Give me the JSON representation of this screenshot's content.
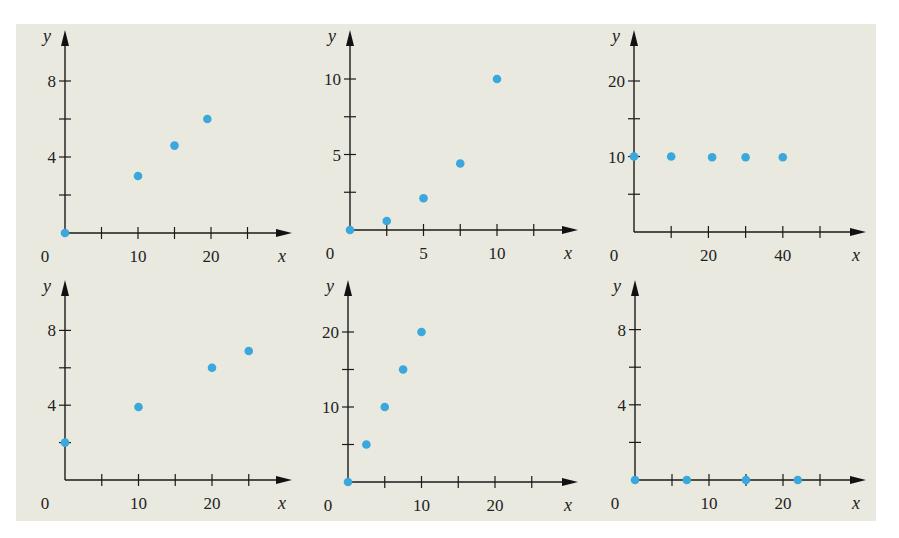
{
  "colors": {
    "background": "#e9e9e0",
    "dot": "#3aa8dc",
    "axis": "#1a1a1a"
  },
  "chart_data": [
    {
      "type": "scatter",
      "title": "",
      "xlabel": "x",
      "ylabel": "y",
      "x_ticks": [
        {
          "value": 0,
          "label": "0"
        },
        {
          "value": 10,
          "label": "10"
        },
        {
          "value": 20,
          "label": "20"
        }
      ],
      "x_minor_step": 5,
      "x_ticks_count": 5,
      "y_ticks": [
        {
          "value": 4,
          "label": "4"
        },
        {
          "value": 8,
          "label": "8"
        }
      ],
      "y_minor_step": 2,
      "y_ticks_count": 4,
      "xlim": [
        0,
        27
      ],
      "ylim": [
        0,
        10
      ],
      "points": [
        {
          "x": 0,
          "y": 0
        },
        {
          "x": 10,
          "y": 3
        },
        {
          "x": 15,
          "y": 4.6
        },
        {
          "x": 19.5,
          "y": 6
        }
      ],
      "layout": {
        "ox": 65,
        "oy": 233,
        "px_per_x": 7.3,
        "px_per_y": 19,
        "x_end": 292,
        "y_top": 30
      }
    },
    {
      "type": "scatter",
      "title": "",
      "xlabel": "x",
      "ylabel": "y",
      "x_ticks": [
        {
          "value": 0,
          "label": "0"
        },
        {
          "value": 5,
          "label": "5"
        },
        {
          "value": 10,
          "label": "10"
        }
      ],
      "x_minor_step": 2.5,
      "x_ticks_count": 5,
      "y_ticks": [
        {
          "value": 5,
          "label": "5"
        },
        {
          "value": 10,
          "label": "10"
        }
      ],
      "y_minor_step": 2.5,
      "y_ticks_count": 4,
      "xlim": [
        0,
        13
      ],
      "ylim": [
        0,
        12
      ],
      "points": [
        {
          "x": 0,
          "y": 0
        },
        {
          "x": 2.5,
          "y": 0.6
        },
        {
          "x": 5,
          "y": 2.1
        },
        {
          "x": 7.5,
          "y": 4.4
        },
        {
          "x": 10,
          "y": 10
        }
      ],
      "layout": {
        "ox": 350,
        "oy": 230,
        "px_per_x": 14.7,
        "px_per_y": 15.1,
        "x_end": 578,
        "y_top": 30
      }
    },
    {
      "type": "scatter",
      "title": "",
      "xlabel": "x",
      "ylabel": "y",
      "x_ticks": [
        {
          "value": 0,
          "label": "0"
        },
        {
          "value": 20,
          "label": "20"
        },
        {
          "value": 40,
          "label": "40"
        }
      ],
      "x_minor_step": 10,
      "x_ticks_count": 5,
      "y_ticks": [
        {
          "value": 10,
          "label": "10"
        },
        {
          "value": 20,
          "label": "20"
        }
      ],
      "y_minor_step": 5,
      "y_ticks_count": 4,
      "xlim": [
        0,
        60
      ],
      "ylim": [
        0,
        25
      ],
      "points": [
        {
          "x": 0,
          "y": 10
        },
        {
          "x": 10,
          "y": 10
        },
        {
          "x": 21,
          "y": 9.9
        },
        {
          "x": 30,
          "y": 9.9
        },
        {
          "x": 40,
          "y": 9.9
        }
      ],
      "layout": {
        "ox": 634,
        "oy": 232,
        "px_per_x": 3.72,
        "px_per_y": 7.55,
        "x_end": 866,
        "y_top": 30
      }
    },
    {
      "type": "scatter",
      "title": "",
      "xlabel": "x",
      "ylabel": "y",
      "x_ticks": [
        {
          "value": 0,
          "label": "0"
        },
        {
          "value": 10,
          "label": "10"
        },
        {
          "value": 20,
          "label": "20"
        }
      ],
      "x_minor_step": 5,
      "x_ticks_count": 5,
      "y_ticks": [
        {
          "value": 4,
          "label": "4"
        },
        {
          "value": 8,
          "label": "8"
        }
      ],
      "y_minor_step": 2,
      "y_ticks_count": 4,
      "xlim": [
        0,
        27
      ],
      "ylim": [
        0,
        10
      ],
      "points": [
        {
          "x": 0,
          "y": 2
        },
        {
          "x": 10,
          "y": 3.9
        },
        {
          "x": 20,
          "y": 6
        },
        {
          "x": 25,
          "y": 6.9
        }
      ],
      "layout": {
        "ox": 65,
        "oy": 480,
        "px_per_x": 7.35,
        "px_per_y": 18.7,
        "x_end": 292,
        "y_top": 280
      }
    },
    {
      "type": "scatter",
      "title": "",
      "xlabel": "x",
      "ylabel": "y",
      "x_ticks": [
        {
          "value": 0,
          "label": "0"
        },
        {
          "value": 10,
          "label": "10"
        },
        {
          "value": 20,
          "label": "20"
        }
      ],
      "x_minor_step": 5,
      "x_ticks_count": 5,
      "y_ticks": [
        {
          "value": 10,
          "label": "10"
        },
        {
          "value": 20,
          "label": "20"
        }
      ],
      "y_minor_step": 5,
      "y_ticks_count": 4,
      "xlim": [
        0,
        27
      ],
      "ylim": [
        0,
        25
      ],
      "points": [
        {
          "x": 0,
          "y": 0
        },
        {
          "x": 2.5,
          "y": 5
        },
        {
          "x": 5,
          "y": 10
        },
        {
          "x": 7.5,
          "y": 15
        },
        {
          "x": 10,
          "y": 20
        }
      ],
      "layout": {
        "ox": 348,
        "oy": 482,
        "px_per_x": 7.35,
        "px_per_y": 7.5,
        "x_end": 578,
        "y_top": 280
      }
    },
    {
      "type": "scatter",
      "title": "",
      "xlabel": "x",
      "ylabel": "y",
      "x_ticks": [
        {
          "value": 0,
          "label": "0"
        },
        {
          "value": 10,
          "label": "10"
        },
        {
          "value": 20,
          "label": "20"
        }
      ],
      "x_minor_step": 5,
      "x_ticks_count": 5,
      "y_ticks": [
        {
          "value": 4,
          "label": "4"
        },
        {
          "value": 8,
          "label": "8"
        }
      ],
      "y_minor_step": 2,
      "y_ticks_count": 4,
      "xlim": [
        0,
        27
      ],
      "ylim": [
        0,
        10
      ],
      "points": [
        {
          "x": 0,
          "y": 0
        },
        {
          "x": 7,
          "y": 0
        },
        {
          "x": 15,
          "y": 0
        },
        {
          "x": 22,
          "y": 0
        }
      ],
      "layout": {
        "ox": 635,
        "oy": 480,
        "px_per_x": 7.4,
        "px_per_y": 18.8,
        "x_end": 866,
        "y_top": 280
      }
    }
  ]
}
